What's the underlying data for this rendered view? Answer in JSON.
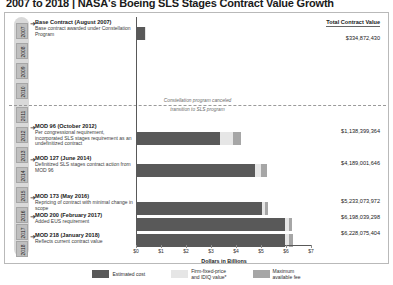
{
  "page_title": "2007 to 2018 | NASA's Boeing SLS Stages Contract Value Growth",
  "figure": {
    "total_contract_value_header": "Total Contract Value",
    "divider_note_line1": "Constellation program canceled",
    "divider_note_line2": "transition to SLS program",
    "years": [
      "2007",
      "2008",
      "2009",
      "2010",
      "2011",
      "2012",
      "2013",
      "2014",
      "2015",
      "2016",
      "2017",
      "2018"
    ],
    "annotations": [
      {
        "title": "Base Contract (August 2007)",
        "desc": "Base contract awarded under Constellation Program",
        "arrow": "➜"
      },
      {
        "title": "MOD 96 (October 2012)",
        "desc": "Per congressional requirement, incorporated SLS stages requirement as an undefinitized contract",
        "arrow": "➜"
      },
      {
        "title": "MOD 127 (June 2014)",
        "desc": "Definitized SLS stages contract action from MOD 96",
        "arrow": "➜"
      },
      {
        "title": "MOD 173 (May 2016)",
        "desc": "Repricing of contract with minimal change in scope",
        "arrow": "➜"
      },
      {
        "title": "MOD 200 (February 2017)",
        "desc": "Added EUS requirement",
        "arrow": "➜"
      },
      {
        "title": "MOD 218 (January 2018)",
        "desc": "Reflects current contract value",
        "arrow": "➜"
      }
    ],
    "legend": [
      {
        "label": "Estimated cost",
        "color": "#595959"
      },
      {
        "label": "Firm-fixed-price\nand IDIQ value*",
        "color": "#e6e6e6"
      },
      {
        "label": "Maximum\navailable fee",
        "color": "#a6a6a6"
      }
    ]
  },
  "chart_data": {
    "type": "bar",
    "orientation": "horizontal",
    "stacked": true,
    "title": "2007 to 2018 | NASA's Boeing SLS Stages Contract Value Growth",
    "xlabel": "Dollars in Billions",
    "ylabel": "",
    "xlim": [
      0,
      7
    ],
    "xticks": [
      0,
      1,
      2,
      3,
      4,
      5,
      6,
      7
    ],
    "xtick_labels": [
      "$0",
      "$1",
      "$2",
      "$3",
      "$4",
      "$5",
      "$6",
      "$7"
    ],
    "grid": false,
    "legend_position": "bottom",
    "categories": [
      "Base Contract (August 2007)",
      "MOD 96 (October 2012)",
      "MOD 127 (June 2014)",
      "MOD 173 (May 2016)",
      "MOD 200 (February 2017)",
      "MOD 218 (January 2018)"
    ],
    "series": [
      {
        "name": "Estimated cost",
        "color": "#595959",
        "values": [
          0.3,
          3.3,
          4.7,
          5.0,
          5.9,
          5.92
        ]
      },
      {
        "name": "Firm-fixed-price and IDIQ value*",
        "color": "#e6e6e6",
        "values": [
          0.035,
          0.55,
          0.25,
          0.13,
          0.16,
          0.16
        ]
      },
      {
        "name": "Maximum available fee",
        "color": "#a6a6a6",
        "values": [
          0.0,
          0.29,
          0.24,
          0.1,
          0.14,
          0.15
        ]
      }
    ],
    "total_contract_values": [
      "$334,872,430",
      "$1,138,399,364",
      "$4,189,001,646",
      "$5,233,073,972",
      "$6,198,039,298",
      "$6,228,075,404"
    ],
    "annotation_line": {
      "text": "Constellation program canceled / transition to SLS program",
      "position_between": [
        "2010",
        "2011"
      ]
    }
  }
}
